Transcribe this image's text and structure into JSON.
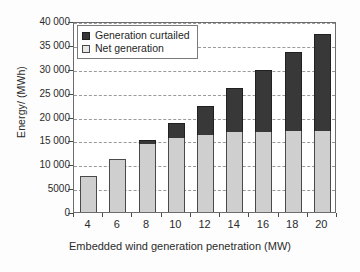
{
  "chart_data": {
    "type": "bar",
    "subtype": "stacked-vertical",
    "title": "",
    "xlabel": "Embedded wind generation penetration (MW)",
    "ylabel": "Energy/ (MWh)",
    "categories": [
      "4",
      "6",
      "8",
      "10",
      "12",
      "14",
      "16",
      "18",
      "20"
    ],
    "series": [
      {
        "name": "Net generation",
        "color": "#cfcfcf",
        "values": [
          7500,
          11200,
          14200,
          15400,
          16200,
          16800,
          16800,
          17000,
          17000
        ]
      },
      {
        "name": "Generation curtailed",
        "color": "#383838",
        "values": [
          0,
          0,
          800,
          3300,
          6100,
          9200,
          13000,
          16500,
          20200
        ]
      }
    ],
    "totals": [
      7500,
      11200,
      15000,
      18700,
      22300,
      26000,
      29800,
      33500,
      37200
    ],
    "ylim": [
      0,
      40000
    ],
    "ytick_values": [
      0,
      5000,
      10000,
      15000,
      20000,
      25000,
      30000,
      35000,
      40000
    ],
    "ytick_labels": [
      "0",
      "5000",
      "10 000",
      "15 000",
      "20 000",
      "25 000",
      "30 000",
      "35 000",
      "40 000"
    ],
    "xtick_labels": [
      "4",
      "6",
      "8",
      "10",
      "12",
      "14",
      "16",
      "18",
      "20"
    ],
    "grid": "horizontal-dashed",
    "legend_position": "upper-left-inside",
    "legend_entries": [
      {
        "label": "Generation curtailed",
        "swatch": "dark"
      },
      {
        "label": "Net generation",
        "swatch": "light"
      }
    ]
  }
}
